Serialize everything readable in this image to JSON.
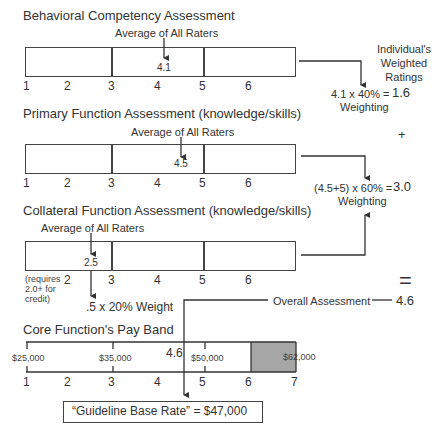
{
  "behavioral": {
    "title": "Behavioral Competency Assessment",
    "avg_label": "Average of All Raters",
    "value": "4.1",
    "ticks": [
      "1",
      "2",
      "3",
      "4",
      "5",
      "6"
    ]
  },
  "primary": {
    "title": "Primary Function Assessment (knowledge/skills)",
    "avg_label": "Average of All Raters",
    "value": "4.5",
    "ticks": [
      "1",
      "2",
      "3",
      "4",
      "5",
      "6"
    ]
  },
  "collateral": {
    "title": "Collateral Function Assessment (knowledge/skills)",
    "avg_label": "Average of All Raters",
    "value": "2.5",
    "note": "(requires 2.0+ for credit)",
    "note_lines": [
      "(requires",
      "2.0+ for",
      "credit)"
    ],
    "ticks": [
      "2",
      "3",
      "4",
      "5",
      "6"
    ],
    "weight_label": ".5 x 20% Weight"
  },
  "weighted": {
    "header_lines": [
      "Individual's",
      "Weighted",
      "Ratings"
    ],
    "behavioral_formula": "4.1 x 40% =",
    "behavioral_result": "1.6",
    "behavioral_sub": "Weighting",
    "plus": "+",
    "primary_formula": "(4.5+5) x 60% =",
    "primary_result": "3.0",
    "primary_sub": "Weighting",
    "equals": "=",
    "overall_label": "Overall Assessment",
    "overall_value": "4.6"
  },
  "payband": {
    "title": "Core Function's Pay Band",
    "salaries": [
      "$25,000",
      "$35,000",
      "$50,000",
      "$62,000"
    ],
    "marker_value": "4.6",
    "ticks": [
      "1",
      "2",
      "3",
      "4",
      "5",
      "6",
      "7"
    ],
    "guideline": "“Guideline Base Rate” = $47,000",
    "shade_color": "#a6a6a6"
  }
}
